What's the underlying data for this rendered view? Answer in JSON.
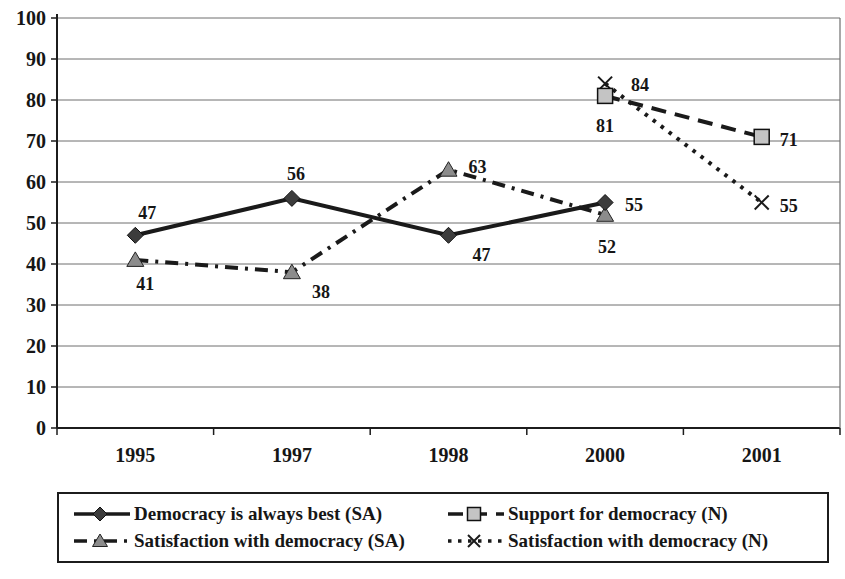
{
  "figure": {
    "background_color": "#ffffff",
    "text_color": "#161616",
    "grid_color": "#6e6e6e",
    "axis_color": "#1c1c1c"
  },
  "chart_data": {
    "type": "line",
    "title": "",
    "xlabel": "",
    "ylabel": "",
    "categories": [
      "1995",
      "1997",
      "1998",
      "2000",
      "2001"
    ],
    "ylim": [
      0,
      100
    ],
    "yticks": [
      0,
      10,
      20,
      30,
      40,
      50,
      60,
      70,
      80,
      90,
      100
    ],
    "grid": true,
    "legend_position": "bottom-box",
    "series": [
      {
        "name": "Democracy is always best (SA)",
        "marker": "diamond",
        "marker_color": "#3c3c3c",
        "line_style": "solid",
        "line_color": "#1a1a1a",
        "x": [
          "1995",
          "1997",
          "1998",
          "2000"
        ],
        "values": [
          47,
          56,
          47,
          55
        ],
        "data_labels": [
          "47",
          "56",
          "47",
          "55"
        ]
      },
      {
        "name": "Support for democracy (N)",
        "marker": "square",
        "marker_color": "#c4c4c4",
        "line_style": "dashed",
        "line_color": "#1a1a1a",
        "x": [
          "2000",
          "2001"
        ],
        "values": [
          81,
          71
        ],
        "data_labels": [
          "81",
          "71"
        ]
      },
      {
        "name": "Satisfaction with democracy (SA)",
        "marker": "triangle",
        "marker_color": "#8c8c8c",
        "line_style": "dashdot",
        "line_color": "#1a1a1a",
        "x": [
          "1995",
          "1997",
          "1998",
          "2000"
        ],
        "values": [
          41,
          38,
          63,
          52
        ],
        "data_labels": [
          "41",
          "38",
          "63",
          "52"
        ]
      },
      {
        "name": "Satisfaction with democracy (N)",
        "marker": "x",
        "marker_color": "#1a1a1a",
        "line_style": "dotted",
        "line_color": "#1a1a1a",
        "x": [
          "2000",
          "2001"
        ],
        "values": [
          84,
          55
        ],
        "data_labels": [
          "84",
          "55"
        ]
      }
    ],
    "legend_entries": [
      "Democracy is always best (SA)",
      "Support for democracy (N)",
      "Satisfaction with democracy (SA)",
      "Satisfaction with democracy (N)"
    ]
  }
}
